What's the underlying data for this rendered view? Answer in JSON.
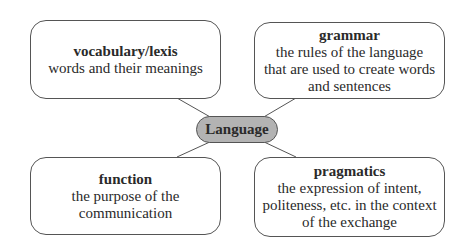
{
  "center": {
    "label": "Language"
  },
  "nodes": [
    {
      "id": "vocabulary",
      "title": "vocabulary/lexis",
      "lines": [
        "words and their meanings"
      ]
    },
    {
      "id": "grammar",
      "title": "grammar",
      "lines": [
        "the rules of the language",
        "that are used to create words",
        "and sentences"
      ]
    },
    {
      "id": "function",
      "title": "function",
      "lines": [
        "the purpose of the",
        "communication"
      ]
    },
    {
      "id": "pragmatics",
      "title": "pragmatics",
      "lines": [
        "the expression of intent,",
        "politeness, etc. in the context",
        "of the exchange"
      ]
    }
  ],
  "colors": {
    "center_fill": "#b3b3b3",
    "border": "#555555"
  }
}
